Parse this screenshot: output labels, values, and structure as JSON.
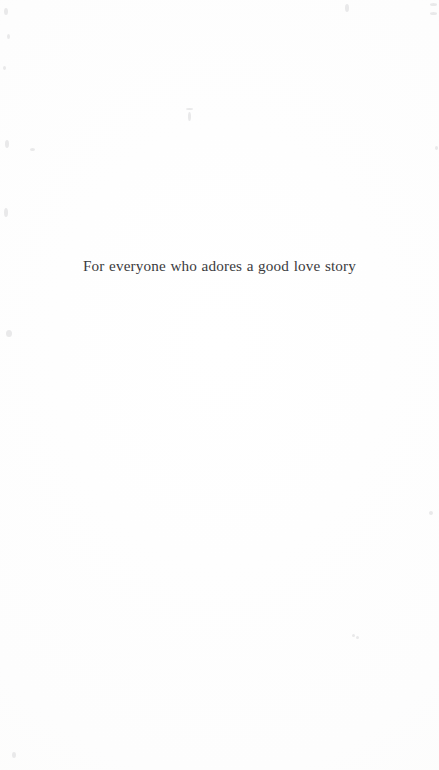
{
  "page": {
    "kind": "book-dedication-page",
    "background_color": "#fdfdfd",
    "width": 439,
    "height": 770
  },
  "dedication": {
    "text": "For everyone who adores a good love story",
    "text_color": "#3b3b3d",
    "align": "center"
  },
  "scan_artifacts": {
    "color": "#e9e9ea",
    "specks": [
      {
        "x": 4,
        "y": 8,
        "w": 4,
        "h": 7
      },
      {
        "x": 7,
        "y": 34,
        "w": 3,
        "h": 5
      },
      {
        "x": 3,
        "y": 66,
        "w": 3,
        "h": 4
      },
      {
        "x": 5,
        "y": 140,
        "w": 4,
        "h": 8
      },
      {
        "x": 30,
        "y": 148,
        "w": 5,
        "h": 3
      },
      {
        "x": 4,
        "y": 208,
        "w": 4,
        "h": 9
      },
      {
        "x": 6,
        "y": 330,
        "w": 6,
        "h": 7
      },
      {
        "x": 12,
        "y": 752,
        "w": 4,
        "h": 6
      },
      {
        "x": 188,
        "y": 112,
        "w": 3,
        "h": 9
      },
      {
        "x": 186,
        "y": 108,
        "w": 7,
        "h": 2
      },
      {
        "x": 345,
        "y": 4,
        "w": 4,
        "h": 8
      },
      {
        "x": 430,
        "y": 3,
        "w": 7,
        "h": 3
      },
      {
        "x": 430,
        "y": 12,
        "w": 7,
        "h": 3
      },
      {
        "x": 429,
        "y": 511,
        "w": 4,
        "h": 4
      },
      {
        "x": 435,
        "y": 146,
        "w": 3,
        "h": 4
      },
      {
        "x": 352,
        "y": 634,
        "w": 3,
        "h": 3
      },
      {
        "x": 356,
        "y": 636,
        "w": 3,
        "h": 3
      }
    ]
  }
}
